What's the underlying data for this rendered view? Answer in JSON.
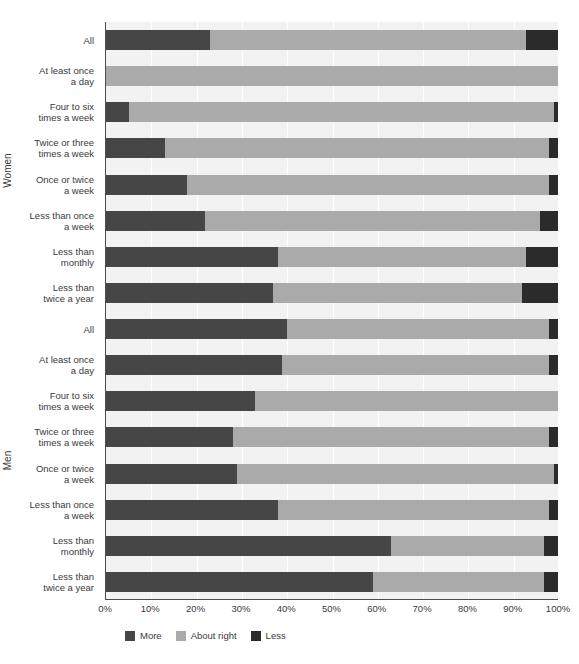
{
  "chart_data": {
    "type": "bar",
    "orientation": "horizontal",
    "stacked": true,
    "normalized_percent": true,
    "title": "",
    "subtitle": "",
    "xlabel": "",
    "ylabel": "",
    "xlim": [
      0,
      100
    ],
    "xticks": [
      "0%",
      "10%",
      "20%",
      "30%",
      "40%",
      "50%",
      "60%",
      "70%",
      "80%",
      "90%",
      "100%"
    ],
    "xtick_values": [
      0,
      10,
      20,
      30,
      40,
      50,
      60,
      70,
      80,
      90,
      100
    ],
    "grid": true,
    "grid_axis": "x",
    "legend_position": "bottom-left",
    "legend": [
      {
        "name": "More",
        "color": "#464646"
      },
      {
        "name": "About right",
        "color": "#aaaaaa"
      },
      {
        "name": "Less",
        "color": "#2b2b2b"
      }
    ],
    "series": [
      {
        "name": "More",
        "color": "#464646"
      },
      {
        "name": "About right",
        "color": "#aaaaaa"
      },
      {
        "name": "Less",
        "color": "#2b2b2b"
      }
    ],
    "groups": [
      {
        "name": "Women",
        "categories": [
          "All",
          "At least once\na day",
          "Four to six\ntimes a week",
          "Twice or three\ntimes a week",
          "Once or twice\na week",
          "Less than once\na week",
          "Less than\nmonthly",
          "Less than\ntwice a year"
        ],
        "rows": [
          {
            "category": "All",
            "more": 23,
            "about_right": 70,
            "less": 7
          },
          {
            "category": "At least once a day",
            "more": 0,
            "about_right": 100,
            "less": 0
          },
          {
            "category": "Four to six times a week",
            "more": 5,
            "about_right": 94,
            "less": 1
          },
          {
            "category": "Twice or three times a week",
            "more": 13,
            "about_right": 85,
            "less": 2
          },
          {
            "category": "Once or twice a week",
            "more": 18,
            "about_right": 80,
            "less": 2
          },
          {
            "category": "Less than once a week",
            "more": 22,
            "about_right": 74,
            "less": 4
          },
          {
            "category": "Less than monthly",
            "more": 38,
            "about_right": 55,
            "less": 7
          },
          {
            "category": "Less than twice a year",
            "more": 37,
            "about_right": 55,
            "less": 8
          }
        ]
      },
      {
        "name": "Men",
        "categories": [
          "All",
          "At least once\na day",
          "Four to six\ntimes a week",
          "Twice or three\ntimes a week",
          "Once or twice\na week",
          "Less than once\na week",
          "Less than\nmonthly",
          "Less than\ntwice a year"
        ],
        "rows": [
          {
            "category": "All",
            "more": 40,
            "about_right": 58,
            "less": 2
          },
          {
            "category": "At least once a day",
            "more": 39,
            "about_right": 59,
            "less": 2
          },
          {
            "category": "Four to six times a week",
            "more": 33,
            "about_right": 67,
            "less": 0
          },
          {
            "category": "Twice or three times a week",
            "more": 28,
            "about_right": 70,
            "less": 2
          },
          {
            "category": "Once or twice a week",
            "more": 29,
            "about_right": 70,
            "less": 1
          },
          {
            "category": "Less than once a week",
            "more": 38,
            "about_right": 60,
            "less": 2
          },
          {
            "category": "Less than monthly",
            "more": 63,
            "about_right": 34,
            "less": 3
          },
          {
            "category": "Less than twice a year",
            "more": 59,
            "about_right": 38,
            "less": 3
          }
        ]
      }
    ]
  },
  "colors": {
    "more": "#464646",
    "about_right": "#aaaaaa",
    "less": "#2b2b2b",
    "plot_background": "#f2f2f2",
    "gridline": "#ffffff",
    "axis": "#4d4d4d",
    "text": "#3a3a3a"
  }
}
